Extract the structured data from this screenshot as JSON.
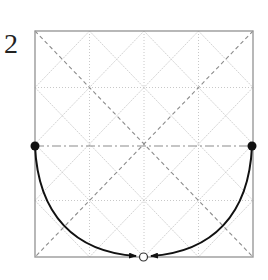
{
  "step": {
    "number": "2"
  },
  "diagram": {
    "type": "origami-fold-step",
    "paper": {
      "x": 35,
      "y": 31,
      "width": 218,
      "height": 226,
      "border_color": "#9a9a9a"
    },
    "grid_color": "#d4d4d4",
    "crease_color": "#8c8c8c",
    "arrow_color": "#111111",
    "fold_line": "horizontal valley fold through center",
    "points": {
      "left": {
        "x": 35,
        "y": 146,
        "style": "filled"
      },
      "right": {
        "x": 252,
        "y": 146,
        "style": "filled"
      },
      "target": {
        "x": 143,
        "y": 257,
        "style": "hollow"
      }
    },
    "arrows": [
      {
        "from": "left",
        "to": "target"
      },
      {
        "from": "right",
        "to": "target"
      }
    ]
  }
}
